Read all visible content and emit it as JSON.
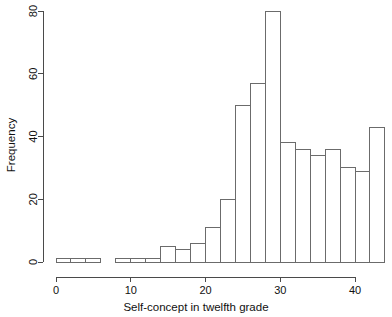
{
  "chart_data": {
    "type": "bar",
    "title": "",
    "subtitle": "",
    "xlabel": "Self-concept in twelfth grade",
    "ylabel": "Frequency",
    "xlim": [
      0,
      44
    ],
    "ylim": [
      0,
      80
    ],
    "xticks": [
      0,
      10,
      20,
      30,
      40
    ],
    "xtick_labels": [
      "0",
      "10",
      "20",
      "30",
      "40"
    ],
    "yticks": [
      0,
      20,
      40,
      60,
      80
    ],
    "ytick_labels": [
      "0",
      "20",
      "40",
      "60",
      "80"
    ],
    "grid": false,
    "legend": null,
    "bin_width": 2,
    "bin_edges": [
      0,
      2,
      4,
      6,
      8,
      10,
      12,
      14,
      16,
      18,
      20,
      22,
      24,
      26,
      28,
      30,
      32,
      34,
      36,
      38,
      40,
      42,
      44
    ],
    "categories": [
      "0-2",
      "2-4",
      "4-6",
      "6-8",
      "8-10",
      "10-12",
      "12-14",
      "14-16",
      "16-18",
      "18-20",
      "20-22",
      "22-24",
      "24-26",
      "26-28",
      "28-30",
      "30-32",
      "32-34",
      "34-36",
      "36-38",
      "38-40",
      "40-42",
      "42-44"
    ],
    "values": [
      1,
      1,
      1,
      0,
      1,
      1,
      1,
      5,
      4,
      6,
      11,
      20,
      50,
      57,
      80,
      38,
      36,
      34,
      36,
      30,
      29,
      43
    ],
    "bar_fill": "#ffffff",
    "bar_stroke": "#6b6b6b",
    "axis_color": "#4a4a4a"
  },
  "axes": {
    "x_title": "Self-concept in twelfth grade",
    "y_title": "Frequency"
  }
}
